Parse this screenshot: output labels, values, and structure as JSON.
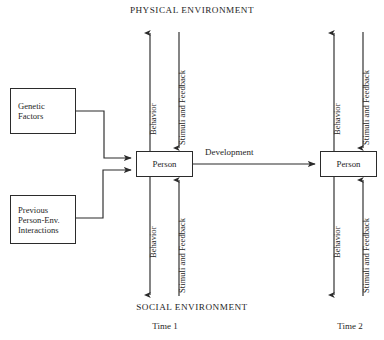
{
  "figure": {
    "kind": "person-environment-interaction-model",
    "background_color": "#ffffff",
    "line_color": "#2b2b2b",
    "text_color": "#262626"
  },
  "headers": {
    "physical_environment": "PHYSICAL ENVIRONMENT",
    "social_environment": "SOCIAL ENVIRONMENT"
  },
  "time_labels": {
    "time1": "Time 1",
    "time2": "Time 2"
  },
  "boxes": {
    "genetic": {
      "line1": "Genetic",
      "line2": "Factors"
    },
    "previous": {
      "line1": "Previous",
      "line2": "Person-Env.",
      "line3": "Interactions"
    },
    "person_time1": "Person",
    "person_time2": "Person"
  },
  "arrow_labels": {
    "development": "Development",
    "behavior": "Behavior",
    "stimuli_and_feedback": "Stimuli and Feedback"
  },
  "arrows": {
    "time1_upper_behavior": {
      "label": "Behavior",
      "direction": "up",
      "environment": "PHYSICAL ENVIRONMENT"
    },
    "time1_upper_stimuli": {
      "label": "Stimuli and Feedback",
      "direction": "down",
      "environment": "PHYSICAL ENVIRONMENT"
    },
    "time1_lower_behavior": {
      "label": "Behavior",
      "direction": "down",
      "environment": "SOCIAL ENVIRONMENT"
    },
    "time1_lower_stimuli": {
      "label": "Stimuli and Feedback",
      "direction": "up",
      "environment": "SOCIAL ENVIRONMENT"
    },
    "time2_upper_behavior": {
      "label": "Behavior",
      "direction": "up",
      "environment": "PHYSICAL ENVIRONMENT"
    },
    "time2_upper_stimuli": {
      "label": "Stimuli and Feedback",
      "direction": "down",
      "environment": "PHYSICAL ENVIRONMENT"
    },
    "time2_lower_behavior": {
      "label": "Behavior",
      "direction": "down",
      "environment": "SOCIAL ENVIRONMENT"
    },
    "time2_lower_stimuli": {
      "label": "Stimuli and Feedback",
      "direction": "up",
      "environment": "SOCIAL ENVIRONMENT"
    }
  }
}
